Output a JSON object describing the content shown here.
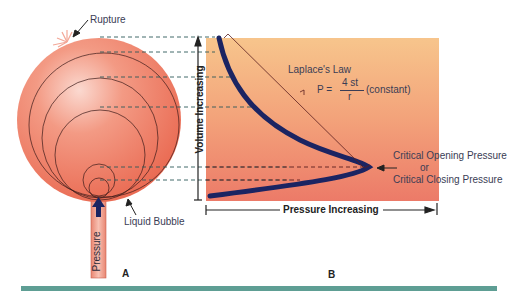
{
  "panel_a": {
    "label": "A",
    "rupture_label": "Rupture",
    "liquid_bubble_label": "Liquid Bubble",
    "tube_label": "Pressure"
  },
  "panel_b": {
    "label": "B",
    "y_axis_label": "Volume Increasing",
    "x_axis_label": "Pressure Increasing",
    "law_title": "Laplace's Law",
    "formula_lhs": "P =",
    "formula_numerator": "4 st",
    "formula_denominator": "r",
    "formula_note": "(constant)",
    "critical_line1": "Critical Opening Pressure",
    "critical_line2": "or",
    "critical_line3": "Critical Closing Pressure"
  },
  "colors": {
    "balloon": "#ee7b62",
    "chart_top": "#f7c48a",
    "chart_bottom": "#ee7f6a",
    "curve": "#1b2462",
    "footer_bar": "#5e9e94",
    "text": "#3a3d55"
  }
}
